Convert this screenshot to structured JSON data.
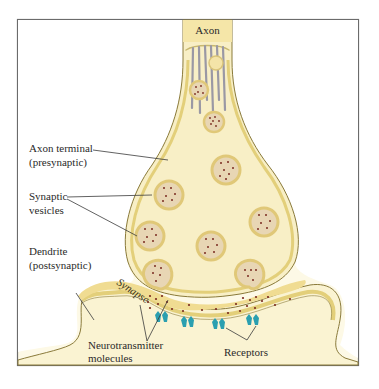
{
  "diagram": {
    "title_label": "Axon",
    "labels": {
      "axon_terminal_line1": "Axon terminal",
      "axon_terminal_line2": "(presynaptic)",
      "synaptic_vesicles_line1": "Synaptic",
      "synaptic_vesicles_line2": "vesicles",
      "dendrite_line1": "Dendrite",
      "dendrite_line2": "(postsynaptic)",
      "synapse": "Synapse",
      "neurotransmitter_line1": "Neurotransmitter",
      "neurotransmitter_line2": "molecules",
      "receptors": "Receptors"
    },
    "colors": {
      "frame_border": "#6b6b6b",
      "background_fill": "#fbf6dc",
      "cell_fill": "#f8f0c8",
      "membrane": "#e3cf7a",
      "membrane_edge": "#8a7a3a",
      "axon_fill": "#f3e3a0",
      "synapse_cleft": "#f0dc92",
      "microtubule": "#9a98a4",
      "vesicle_fill": "#e8d6b4",
      "vesicle_ring": "#e0c878",
      "neurotransmitter": "#7a2a20",
      "receptor": "#2a9fb0"
    }
  }
}
